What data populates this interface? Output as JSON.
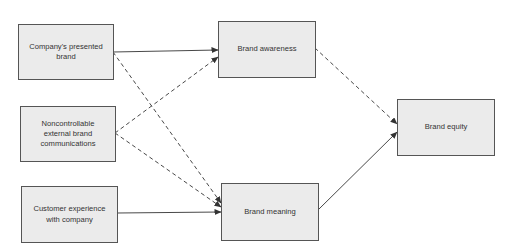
{
  "diagram": {
    "nodes": [
      {
        "id": "company_presented_brand",
        "label": "Company's presented brand"
      },
      {
        "id": "noncontrollable_external",
        "label": "Noncontrollable external brand communications"
      },
      {
        "id": "customer_experience",
        "label": "Customer experience with company"
      },
      {
        "id": "brand_awareness",
        "label": "Brand awareness"
      },
      {
        "id": "brand_meaning",
        "label": "Brand meaning"
      },
      {
        "id": "brand_equity",
        "label": "Brand equity"
      }
    ],
    "edges": [
      {
        "from": "company_presented_brand",
        "to": "brand_awareness",
        "style": "solid"
      },
      {
        "from": "company_presented_brand",
        "to": "brand_meaning",
        "style": "dashed"
      },
      {
        "from": "noncontrollable_external",
        "to": "brand_awareness",
        "style": "dashed"
      },
      {
        "from": "noncontrollable_external",
        "to": "brand_meaning",
        "style": "dashed"
      },
      {
        "from": "customer_experience",
        "to": "brand_meaning",
        "style": "solid"
      },
      {
        "from": "brand_awareness",
        "to": "brand_equity",
        "style": "dashed"
      },
      {
        "from": "brand_meaning",
        "to": "brand_equity",
        "style": "solid"
      }
    ],
    "colors": {
      "box_fill": "#ebebeb",
      "box_border": "#555555",
      "line": "#333333",
      "text": "#333333"
    }
  }
}
